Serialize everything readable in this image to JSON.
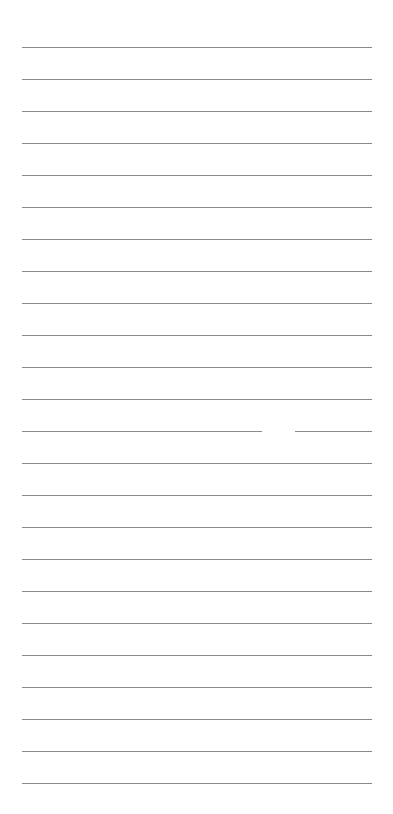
{
  "page": {
    "type": "lined-paper",
    "background": "#ffffff",
    "line_color": "#8a8a8a",
    "line_count": 24,
    "first_line_y": 47,
    "line_spacing": 32,
    "line_left": 22,
    "line_right": 372,
    "gap": {
      "line_index": 12,
      "x_start": 262,
      "x_end": 295
    }
  }
}
